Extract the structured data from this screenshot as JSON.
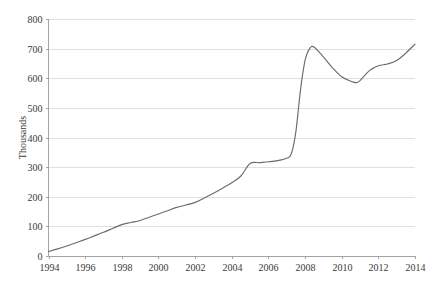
{
  "chart_data": {
    "type": "line",
    "title": "",
    "subtitle": "",
    "xlabel": "",
    "ylabel": "Thousands",
    "xlim": [
      1994,
      2014
    ],
    "ylim": [
      0,
      800
    ],
    "grid": true,
    "legend": null,
    "legend_position": "none",
    "line_color": "#6b6b6b",
    "y_ticks": [
      0,
      100,
      200,
      300,
      400,
      500,
      600,
      700,
      800
    ],
    "y_tick_labels": [
      "0",
      "100",
      "200",
      "300",
      "400",
      "500",
      "600",
      "700",
      "800"
    ],
    "x_ticks": [
      1994,
      1996,
      1998,
      2000,
      2002,
      2004,
      2006,
      2008,
      2010,
      2012,
      2014
    ],
    "x_tick_labels": [
      "1994",
      "1996",
      "1998",
      "2000",
      "2002",
      "2004",
      "2006",
      "2008",
      "2010",
      "2012",
      "2014"
    ],
    "series": [
      {
        "name": "value",
        "x": [
          1994,
          1994.5,
          1995,
          1995.5,
          1996,
          1996.5,
          1997,
          1997.5,
          1998,
          1998.5,
          1999,
          1999.5,
          2000,
          2000.5,
          2001,
          2001.5,
          2002,
          2002.5,
          2003,
          2003.5,
          2004,
          2004.5,
          2005,
          2005.5,
          2006,
          2006.5,
          2007,
          2007.25,
          2007.5,
          2007.75,
          2008,
          2008.25,
          2008.5,
          2009,
          2009.5,
          2010,
          2010.5,
          2010.8,
          2011,
          2011.5,
          2012,
          2012.5,
          2013,
          2013.5,
          2014
        ],
        "y": [
          15,
          24,
          34,
          45,
          56,
          68,
          80,
          93,
          106,
          113,
          120,
          131,
          142,
          153,
          164,
          172,
          181,
          196,
          212,
          229,
          247,
          270,
          312,
          315,
          318,
          322,
          330,
          345,
          420,
          560,
          660,
          700,
          705,
          672,
          635,
          605,
          590,
          585,
          592,
          625,
          642,
          648,
          660,
          685,
          715
        ]
      }
    ]
  }
}
